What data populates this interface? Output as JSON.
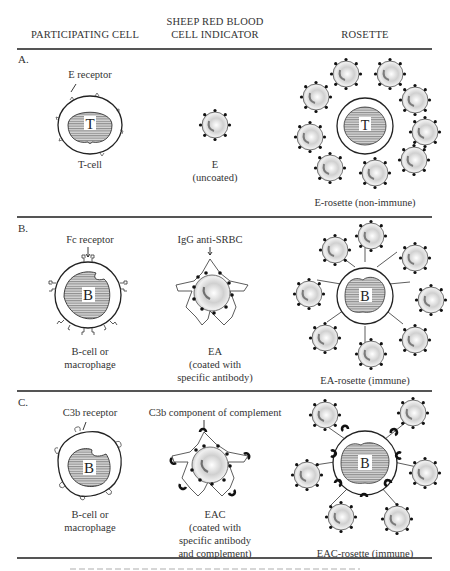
{
  "header": {
    "col1": "PARTICIPATING CELL",
    "col2_line1": "SHEEP RED BLOOD",
    "col2_line2": "CELL INDICATOR",
    "col3": "ROSETTE"
  },
  "rows": [
    {
      "section": "A.",
      "receptor_label": "E receptor",
      "cell_letter": "T",
      "cell_label": "T-cell",
      "indicator_title": "E",
      "indicator_sub": [
        "(uncoated)"
      ],
      "rosette_label": "E-rosette (non-immune)"
    },
    {
      "section": "B.",
      "receptor_label": "Fc receptor",
      "cell_letter": "B",
      "cell_label": [
        "B-cell or",
        "macrophage"
      ],
      "indicator_arrow_label": "IgG anti-SRBC",
      "indicator_title": "EA",
      "indicator_sub": [
        "(coated with",
        "specific antibody)"
      ],
      "rosette_label": "EA-rosette (immune)"
    },
    {
      "section": "C.",
      "receptor_label": "C3b receptor",
      "cell_letter": "B",
      "cell_label": [
        "B-cell or",
        "macrophage"
      ],
      "indicator_arrow_label": "C3b component of complement",
      "indicator_title": "EAC",
      "indicator_sub": [
        "(coated with",
        "specific antibody",
        "and complement)"
      ],
      "rosette_label": "EAC-rosette (immune)"
    }
  ],
  "colors": {
    "ink": "#2a2a2a",
    "rule": "#555555",
    "rbc_fill": "#e6e6e6",
    "nucleus_hatch": "#777777"
  }
}
